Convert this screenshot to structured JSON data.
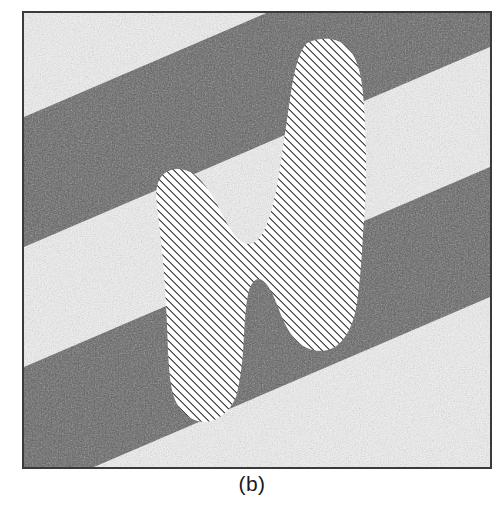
{
  "figure": {
    "caption": "(b)",
    "panel_label": "b",
    "frame": {
      "x": 22,
      "y": 11,
      "width": 470,
      "height": 458,
      "border_color": "#3a3a3a",
      "border_width": 2
    },
    "colors": {
      "background_light": "#f2f2f2",
      "background_dark": "#5f5f5f",
      "hatch_line": "#111111",
      "hatch_fill": "#ffffff",
      "frame_border": "#3a3a3a",
      "caption_text": "#1a1a1a",
      "page_background": "#ffffff"
    },
    "background": {
      "type": "diagonal-noisy-stripes",
      "stripe_angle_deg": -25,
      "stripes": [
        {
          "index": 0,
          "tone": "light",
          "left_edge_y": 0,
          "right_edge_y": 0
        },
        {
          "index": 1,
          "tone": "dark",
          "left_edge_y": 104,
          "right_edge_y": -96
        },
        {
          "index": 2,
          "tone": "light",
          "left_edge_y": 234,
          "right_edge_y": 34
        },
        {
          "index": 3,
          "tone": "dark",
          "left_edge_y": 354,
          "right_edge_y": 154
        },
        {
          "index": 4,
          "tone": "light",
          "left_edge_y": 484,
          "right_edge_y": 284
        }
      ],
      "noise": {
        "enabled": true,
        "grain_size_px": 2,
        "amplitude": 0.16
      }
    },
    "object": {
      "name": "hatched-silhouette",
      "fill": "diagonal-hatch",
      "hatch": {
        "angle_deg": 45,
        "spacing_px": 4,
        "line_width_px": 1.4,
        "direction": "lower-left-to-upper-right"
      },
      "outline_points": "283,30 300,26 318,29 330,40 337,57 340,80 341,104 342,128 342,150 341,174 340,196 339,216 338,238 337,262 335,286 331,306 323,323 311,334 297,339 283,336 272,327 264,314 258,298 252,283 246,272 240,266 234,268 229,277 226,292 224,308 222,330 220,352 216,374 209,391 198,403 184,409 170,406 159,396 152,382 148,364 147,343 146,318 145,292 143,266 140,240 136,216 133,196 133,180 137,168 146,160 157,157 170,160 181,169 190,183 198,200 206,216 214,227 222,231 230,228 237,218 243,202 249,180 254,155 259,128 263,101 267,76 272,52 277,36"
    }
  }
}
